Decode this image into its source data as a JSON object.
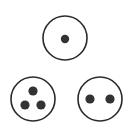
{
  "canvas": {
    "width": 134,
    "height": 132,
    "background_color": "#ffffff"
  },
  "style": {
    "circle_stroke_color": "#2b2b2b",
    "circle_fill_color": "#ffffff",
    "circle_stroke_width": 1.6,
    "dot_color": "#333333"
  },
  "figure": {
    "type": "dot-circles",
    "shapes": [
      {
        "id": "circle-top",
        "name": "circle-one-dot",
        "dot_count": 1,
        "center": {
          "x": 65,
          "y": 38
        },
        "radius": 22,
        "dots": [
          {
            "x": 65,
            "y": 39,
            "r": 4.2
          }
        ]
      },
      {
        "id": "circle-bottom-left",
        "name": "circle-three-dots",
        "dot_count": 3,
        "center": {
          "x": 33,
          "y": 99
        },
        "radius": 22,
        "dots": [
          {
            "x": 33,
            "y": 91,
            "r": 4.6
          },
          {
            "x": 25,
            "y": 105,
            "r": 4.6
          },
          {
            "x": 41,
            "y": 105,
            "r": 4.6
          }
        ]
      },
      {
        "id": "circle-bottom-right",
        "name": "circle-two-dots",
        "dot_count": 2,
        "center": {
          "x": 100,
          "y": 99
        },
        "radius": 22,
        "dots": [
          {
            "x": 90,
            "y": 99,
            "r": 4.6
          },
          {
            "x": 110,
            "y": 99,
            "r": 4.6
          }
        ]
      }
    ]
  }
}
